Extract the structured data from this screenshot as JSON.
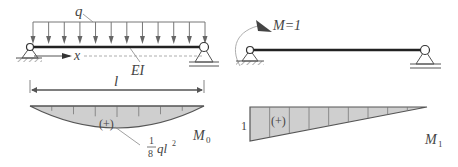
{
  "left_diagram": {
    "load_label": "q",
    "axis_label": "x",
    "stiffness_label": "EI",
    "span_label": "l",
    "moment_diagram_label": "M",
    "moment_diagram_subscript": "0",
    "sign_label": "(+)",
    "peak_value_fraction_num": "1",
    "peak_value_fraction_den": "8",
    "peak_value_expr": "ql",
    "peak_value_exp": "2",
    "load_arrow_count": 12
  },
  "right_diagram": {
    "applied_moment_label": "M=1",
    "moment_diagram_label": "M",
    "moment_diagram_subscript": "1",
    "sign_label": "(+)",
    "left_value": "1"
  },
  "colors": {
    "line": "#555555",
    "beam": "#222222",
    "fill": "#cfcfcf",
    "text": "#444444"
  }
}
